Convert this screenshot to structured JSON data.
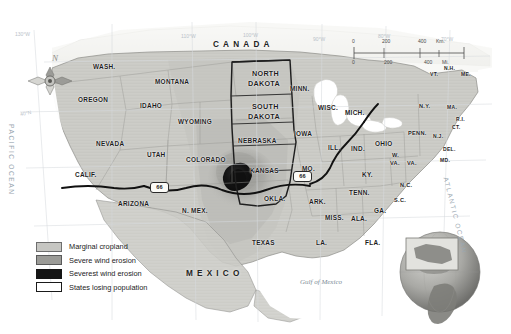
{
  "map": {
    "title": "Dust Bowl and Marginal Cropland of the United States",
    "countries": [
      {
        "name": "CANADA",
        "x": 213,
        "y": 40
      },
      {
        "name": "MEXICO",
        "x": 186,
        "y": 269
      }
    ],
    "water_labels": [
      {
        "name": "Gulf of Mexico",
        "x": 300,
        "y": 278
      }
    ],
    "oceans": [
      {
        "name": "PACIFIC OCEAN",
        "x": 12,
        "y": 128
      },
      {
        "name": "ATLANTIC OCEAN",
        "x": 452,
        "y": 178
      }
    ],
    "graticules": [
      {
        "label": "130°W",
        "x": 17,
        "y": 33
      },
      {
        "label": "110°W",
        "x": 183,
        "y": 35
      },
      {
        "label": "100°W",
        "x": 244,
        "y": 34
      },
      {
        "label": "90°W",
        "x": 315,
        "y": 38
      },
      {
        "label": "80°W",
        "x": 380,
        "y": 35
      },
      {
        "label": "70°W",
        "x": 443,
        "y": 38
      },
      {
        "label": "40°N",
        "x": 22,
        "y": 112
      }
    ],
    "states": [
      {
        "abbr": "WASH.",
        "x": 93,
        "y": 64,
        "size": "state-md"
      },
      {
        "abbr": "OREGON",
        "x": 78,
        "y": 97,
        "size": "state-md"
      },
      {
        "abbr": "IDAHO",
        "x": 140,
        "y": 103,
        "size": "state-md"
      },
      {
        "abbr": "MONTANA",
        "x": 155,
        "y": 79,
        "size": "state-md"
      },
      {
        "abbr": "WYOMING",
        "x": 178,
        "y": 119,
        "size": "state-md"
      },
      {
        "abbr": "NEVADA",
        "x": 96,
        "y": 141,
        "size": "state-md"
      },
      {
        "abbr": "UTAH",
        "x": 147,
        "y": 152,
        "size": "state-md"
      },
      {
        "abbr": "COLORADO",
        "x": 186,
        "y": 157,
        "size": "state-md"
      },
      {
        "abbr": "CALIF.",
        "x": 75,
        "y": 172,
        "size": "state-md"
      },
      {
        "abbr": "ARIZONA",
        "x": 118,
        "y": 201,
        "size": "state-md"
      },
      {
        "abbr": "N. MEX.",
        "x": 182,
        "y": 208,
        "size": "state-md"
      },
      {
        "abbr": "NORTH",
        "x": 252,
        "y": 70,
        "size": "state-lg"
      },
      {
        "abbr": "DAKOTA",
        "x": 248,
        "y": 80,
        "size": "state-lg"
      },
      {
        "abbr": "SOUTH",
        "x": 252,
        "y": 103,
        "size": "state-lg"
      },
      {
        "abbr": "DAKOTA",
        "x": 248,
        "y": 113,
        "size": "state-lg"
      },
      {
        "abbr": "NEBRASKA",
        "x": 238,
        "y": 138,
        "size": "state-md"
      },
      {
        "abbr": "KANSAS",
        "x": 250,
        "y": 168,
        "size": "state-md"
      },
      {
        "abbr": "OKLA.",
        "x": 264,
        "y": 196,
        "size": "state-md"
      },
      {
        "abbr": "TEXAS",
        "x": 252,
        "y": 240,
        "size": "state-md"
      },
      {
        "abbr": "MINN.",
        "x": 290,
        "y": 86,
        "size": "state-md"
      },
      {
        "abbr": "IOWA",
        "x": 294,
        "y": 131,
        "size": "state-md"
      },
      {
        "abbr": "MO.",
        "x": 302,
        "y": 166,
        "size": "state-md"
      },
      {
        "abbr": "WISC.",
        "x": 318,
        "y": 105,
        "size": "state-md"
      },
      {
        "abbr": "ILL.",
        "x": 328,
        "y": 145,
        "size": "state-md"
      },
      {
        "abbr": "IND.",
        "x": 351,
        "y": 146,
        "size": "state-md"
      },
      {
        "abbr": "MICH.",
        "x": 345,
        "y": 110,
        "size": "state-md"
      },
      {
        "abbr": "OHIO",
        "x": 375,
        "y": 141,
        "size": "state-md"
      },
      {
        "abbr": "KY.",
        "x": 362,
        "y": 172,
        "size": "state-md"
      },
      {
        "abbr": "TENN.",
        "x": 349,
        "y": 190,
        "size": "state-md"
      },
      {
        "abbr": "ARK.",
        "x": 309,
        "y": 199,
        "size": "state-md"
      },
      {
        "abbr": "MISS.",
        "x": 325,
        "y": 215,
        "size": "state-md"
      },
      {
        "abbr": "ALA.",
        "x": 351,
        "y": 216,
        "size": "state-md"
      },
      {
        "abbr": "LA.",
        "x": 316,
        "y": 240,
        "size": "state-md"
      },
      {
        "abbr": "FLA.",
        "x": 365,
        "y": 240,
        "size": "state-md"
      },
      {
        "abbr": "GA.",
        "x": 374,
        "y": 208,
        "size": "state-md"
      },
      {
        "abbr": "S.C.",
        "x": 394,
        "y": 198,
        "size": "state-sm"
      },
      {
        "abbr": "N.C.",
        "x": 400,
        "y": 183,
        "size": "state-sm"
      },
      {
        "abbr": "VA.",
        "x": 407,
        "y": 161,
        "size": "state-sm"
      },
      {
        "abbr": "W.",
        "x": 392,
        "y": 153,
        "size": "state-sm"
      },
      {
        "abbr": "VA.",
        "x": 390,
        "y": 161,
        "size": "state-sm"
      },
      {
        "abbr": "PENN.",
        "x": 408,
        "y": 131,
        "size": "state-sm"
      },
      {
        "abbr": "N.Y.",
        "x": 419,
        "y": 104,
        "size": "state-sm"
      },
      {
        "abbr": "VT.",
        "x": 430,
        "y": 72,
        "size": "state-xs"
      },
      {
        "abbr": "N.H.",
        "x": 444,
        "y": 66,
        "size": "state-xs"
      },
      {
        "abbr": "ME.",
        "x": 461,
        "y": 72,
        "size": "state-xs"
      },
      {
        "abbr": "MA.",
        "x": 447,
        "y": 105,
        "size": "state-xs"
      },
      {
        "abbr": "R.I.",
        "x": 456,
        "y": 117,
        "size": "state-xs"
      },
      {
        "abbr": "CT.",
        "x": 452,
        "y": 125,
        "size": "state-xs"
      },
      {
        "abbr": "N.J.",
        "x": 433,
        "y": 134,
        "size": "state-xs"
      },
      {
        "abbr": "DEL.",
        "x": 443,
        "y": 147,
        "size": "state-xs"
      },
      {
        "abbr": "MD.",
        "x": 440,
        "y": 158,
        "size": "state-xs"
      }
    ],
    "route_shields": [
      {
        "label": "66",
        "x": 150,
        "y": 186
      },
      {
        "label": "66",
        "x": 293,
        "y": 175
      }
    ],
    "compass": {
      "north_label": "N"
    },
    "scale_bar": {
      "km_ticks": [
        "0",
        "200",
        "400"
      ],
      "km_unit": "Km.",
      "mi_ticks": [
        "0",
        "200",
        "400"
      ],
      "mi_unit": "Mi."
    },
    "legend": {
      "items": [
        {
          "label": "Marginal cropland",
          "color": "#c6c6c2",
          "border": "#6e6e6e"
        },
        {
          "label": "Severe wind erosion",
          "color": "#9b9b97",
          "border": "#5a5a5a"
        },
        {
          "label": "Severest wind erosion",
          "color": "#151515",
          "border": "#151515"
        },
        {
          "label": "States losing population",
          "color": "#ffffff",
          "border": "#1a1a1a"
        }
      ]
    },
    "globe_inset": {
      "highlight_region": "United States"
    }
  },
  "colors": {
    "land": "#cfcfca",
    "marginal_cropland": "#c4c4bf",
    "severe_erosion": "#9b9b97",
    "severest_erosion": "#1a1a1a",
    "water": "#ffffff",
    "border": "#8a8a86",
    "losing_population_outline": "#1f1f1f"
  }
}
